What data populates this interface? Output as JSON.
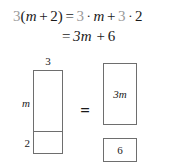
{
  "equation": {
    "line1": {
      "coefficient_left": "3",
      "open_paren": "(",
      "variable": "m",
      "plus_inner": "+",
      "constant_inner": "2",
      "close_paren": ")",
      "equals": "=",
      "coefficient_term1": "3",
      "dot1": "·",
      "variable_term1": "m",
      "plus_outer": "+",
      "coefficient_term2": "3",
      "dot2": "·",
      "constant_term2": "2",
      "full_text": "3(m + 2) = 3 · m + 3 · 2"
    },
    "line2": {
      "equals": "=",
      "term1": "3m",
      "plus": "+",
      "term2": "6",
      "full_text": "= 3m + 6"
    }
  },
  "diagram": {
    "equals_sign": "=",
    "left_model": {
      "width_label": "3",
      "upper_height_label": "m",
      "lower_height_label": "2"
    },
    "right_model": {
      "box_top_label": "3m",
      "box_bottom_label": "6"
    }
  },
  "colors": {
    "text": "#1a1a1a",
    "highlight_gray": "#9a9a9a",
    "rect_border": "#6e6e6e",
    "background": "#ffffff"
  }
}
